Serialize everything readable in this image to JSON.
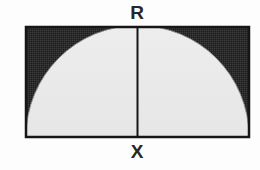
{
  "figure": {
    "type": "geometry-diagram",
    "labels": {
      "radius_top": "R",
      "base_midpoint": "X"
    },
    "colors": {
      "background": "#fdfdfd",
      "outline": "#161616",
      "shaded_region": "#2e2e2e",
      "semicircle_fill": "#eaeaea",
      "label_text": "#272727"
    },
    "rectangle": {
      "name": "bounding-rectangle",
      "x": 26,
      "y": 27,
      "width": 223,
      "height": 110,
      "stroke_width": 2.5
    },
    "semicircle": {
      "name": "inscribed-semicircle",
      "center_x": 137.5,
      "center_y": 137,
      "radius": 111.5,
      "orientation": "flat-side-down"
    },
    "radius_segment": {
      "name": "radius-line",
      "x": 137.5,
      "y_top": 27,
      "y_bottom": 137,
      "stroke_width": 2
    }
  }
}
